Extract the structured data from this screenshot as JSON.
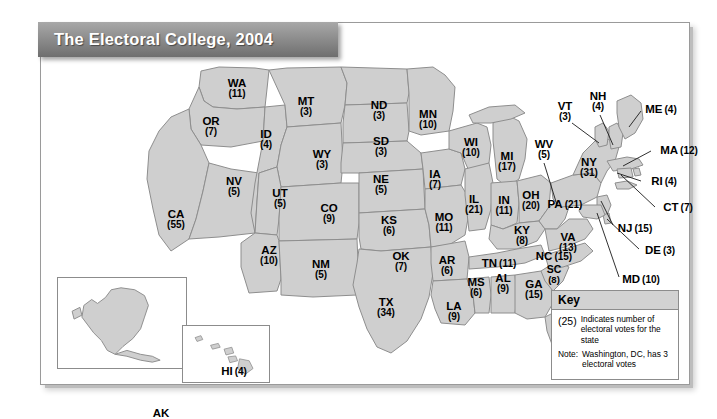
{
  "title": "The Electoral College, 2004",
  "map": {
    "states": [
      {
        "code": "WA",
        "votes": "(11)",
        "x": 196,
        "y": 66,
        "style": "stack"
      },
      {
        "code": "OR",
        "votes": "(7)",
        "x": 170,
        "y": 104,
        "style": "stack"
      },
      {
        "code": "CA",
        "votes": "(55)",
        "x": 135,
        "y": 197,
        "style": "stack"
      },
      {
        "code": "NV",
        "votes": "(5)",
        "x": 193,
        "y": 164,
        "style": "stack"
      },
      {
        "code": "ID",
        "votes": "(4)",
        "x": 225,
        "y": 117,
        "style": "stack"
      },
      {
        "code": "MT",
        "votes": "(3)",
        "x": 265,
        "y": 84,
        "style": "stack"
      },
      {
        "code": "WY",
        "votes": "(3)",
        "x": 281,
        "y": 137,
        "style": "stack"
      },
      {
        "code": "UT",
        "votes": "(5)",
        "x": 239,
        "y": 176,
        "style": "stack"
      },
      {
        "code": "CO",
        "votes": "(9)",
        "x": 288,
        "y": 191,
        "style": "stack"
      },
      {
        "code": "AZ",
        "votes": "(10)",
        "x": 228,
        "y": 233,
        "style": "stack"
      },
      {
        "code": "NM",
        "votes": "(5)",
        "x": 280,
        "y": 247,
        "style": "stack"
      },
      {
        "code": "ND",
        "votes": "(3)",
        "x": 338,
        "y": 88,
        "style": "stack"
      },
      {
        "code": "SD",
        "votes": "(3)",
        "x": 340,
        "y": 124,
        "style": "stack"
      },
      {
        "code": "NE",
        "votes": "(5)",
        "x": 340,
        "y": 162,
        "style": "stack"
      },
      {
        "code": "KS",
        "votes": "(6)",
        "x": 348,
        "y": 203,
        "style": "stack"
      },
      {
        "code": "OK",
        "votes": "(7)",
        "x": 360,
        "y": 239,
        "style": "stack"
      },
      {
        "code": "TX",
        "votes": "(34)",
        "x": 345,
        "y": 285,
        "style": "stack"
      },
      {
        "code": "MN",
        "votes": "(10)",
        "x": 387,
        "y": 97,
        "style": "stack"
      },
      {
        "code": "IA",
        "votes": "(7)",
        "x": 394,
        "y": 157,
        "style": "stack"
      },
      {
        "code": "MO",
        "votes": "(11)",
        "x": 403,
        "y": 200,
        "style": "stack"
      },
      {
        "code": "AR",
        "votes": "(6)",
        "x": 406,
        "y": 243,
        "style": "stack"
      },
      {
        "code": "LA",
        "votes": "(9)",
        "x": 413,
        "y": 289,
        "style": "stack"
      },
      {
        "code": "WI",
        "votes": "(10)",
        "x": 430,
        "y": 125,
        "style": "stack"
      },
      {
        "code": "IL",
        "votes": "(21)",
        "x": 433,
        "y": 182,
        "style": "stack"
      },
      {
        "code": "MS",
        "votes": "(6)",
        "x": 435,
        "y": 265,
        "style": "stack"
      },
      {
        "code": "MI",
        "votes": "(17)",
        "x": 466,
        "y": 139,
        "style": "stack"
      },
      {
        "code": "IN",
        "votes": "(11)",
        "x": 463,
        "y": 183,
        "style": "stack"
      },
      {
        "code": "AL",
        "votes": "(9)",
        "x": 462,
        "y": 261,
        "style": "stack"
      },
      {
        "code": "OH",
        "votes": "(20)",
        "x": 490,
        "y": 178,
        "style": "stack"
      },
      {
        "code": "KY",
        "votes": "(8)",
        "x": 481,
        "y": 213,
        "style": "stack"
      },
      {
        "code": "TN",
        "votes": "(11)",
        "x": 458,
        "y": 239,
        "style": "inline"
      },
      {
        "code": "GA",
        "votes": "(15)",
        "x": 493,
        "y": 267,
        "style": "stack"
      },
      {
        "code": "SC",
        "votes": "(8)",
        "x": 513,
        "y": 252,
        "style": "stack-sm"
      },
      {
        "code": "NC",
        "votes": "(15)",
        "x": 513,
        "y": 232,
        "style": "inline"
      },
      {
        "code": "FL",
        "votes": "(27)",
        "x": 520,
        "y": 325,
        "style": "stack"
      },
      {
        "code": "WV",
        "votes": "(5)",
        "x": 503,
        "y": 127,
        "style": "stack"
      },
      {
        "code": "VA",
        "votes": "(13)",
        "x": 527,
        "y": 220,
        "style": "stack"
      },
      {
        "code": "PA",
        "votes": "(21)",
        "x": 524,
        "y": 180,
        "style": "inline"
      },
      {
        "code": "NY",
        "votes": "(31)",
        "x": 548,
        "y": 145,
        "style": "stack"
      },
      {
        "code": "VT",
        "votes": "(3)",
        "x": 524,
        "y": 89,
        "style": "stack"
      },
      {
        "code": "NH",
        "votes": "(4)",
        "x": 557,
        "y": 79,
        "style": "stack"
      },
      {
        "code": "ME",
        "votes": "(4)",
        "x": 620,
        "y": 85,
        "style": "inline"
      },
      {
        "code": "MA",
        "votes": "(12)",
        "x": 638,
        "y": 126,
        "style": "inline"
      },
      {
        "code": "RI",
        "votes": "(4)",
        "x": 623,
        "y": 157,
        "style": "inline"
      },
      {
        "code": "CT",
        "votes": "(7)",
        "x": 637,
        "y": 183,
        "style": "inline"
      },
      {
        "code": "NJ",
        "votes": "(15)",
        "x": 594,
        "y": 204,
        "style": "inline"
      },
      {
        "code": "DE",
        "votes": "(3)",
        "x": 619,
        "y": 226,
        "style": "inline"
      },
      {
        "code": "MD",
        "votes": "(10)",
        "x": 600,
        "y": 255,
        "style": "inline"
      },
      {
        "code": "AK",
        "votes": "(3)",
        "x": 103,
        "y": 141,
        "style": "stack",
        "inset": "ak"
      },
      {
        "code": "HI",
        "votes": "(4)",
        "x": 51,
        "y": 44,
        "style": "inline",
        "inset": "hi"
      }
    ]
  },
  "key": {
    "heading": "Key",
    "sample": "(25)",
    "sample_desc": "Indicates number of electoral votes for the state",
    "note_label": "Note:",
    "note_text": "Washington, DC, has 3 electoral votes"
  },
  "colors": {
    "state_fill": "#cfcfcf",
    "state_stroke": "#8e8e8e",
    "coast_stroke": "#6f6f6f",
    "water": "#ffffff",
    "title_text": "#ffffff"
  }
}
